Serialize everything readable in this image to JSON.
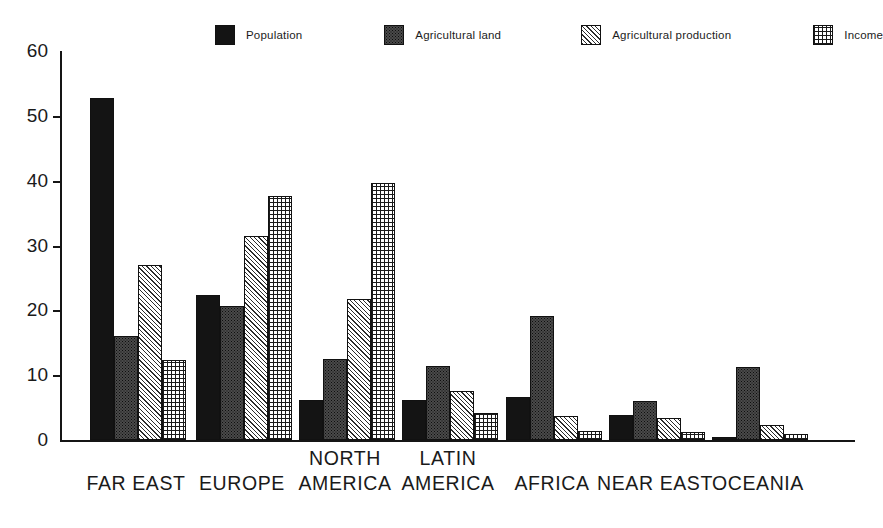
{
  "chart_data": {
    "type": "bar",
    "title": "",
    "subtitle": "",
    "xlabel": "",
    "ylabel": "",
    "ylim": [
      0,
      60
    ],
    "yticks": [
      0,
      10,
      20,
      30,
      40,
      50,
      60
    ],
    "ytick_labels": [
      "0",
      "10",
      "20",
      "30",
      "40",
      "50",
      "60"
    ],
    "grid": false,
    "legend_position": "top",
    "categories": [
      "FAR EAST",
      "EUROPE",
      "NORTH AMERICA",
      "LATIN AMERICA",
      "AFRICA",
      "NEAR EAST",
      "OCEANIA"
    ],
    "category_lines": [
      [
        "FAR EAST"
      ],
      [
        "EUROPE"
      ],
      [
        "NORTH",
        "AMERICA"
      ],
      [
        "LATIN",
        "AMERICA"
      ],
      [
        "AFRICA"
      ],
      [
        "NEAR EAST"
      ],
      [
        "OCEANIA"
      ]
    ],
    "series": [
      {
        "name": "Population",
        "pattern": "solid-black",
        "values": [
          52.7,
          22.3,
          6.2,
          6.2,
          6.6,
          3.9,
          0.4
        ]
      },
      {
        "name": "Agricultural land",
        "pattern": "fine-dots",
        "values": [
          16.0,
          20.6,
          12.5,
          11.4,
          19.2,
          6.0,
          11.2
        ]
      },
      {
        "name": "Agricultural production",
        "pattern": "diagonal-hatch",
        "values": [
          27.0,
          31.5,
          21.8,
          7.6,
          3.7,
          3.4,
          2.3
        ]
      },
      {
        "name": "Income",
        "pattern": "cross-hatch",
        "values": [
          12.3,
          37.7,
          39.7,
          4.2,
          1.4,
          1.2,
          0.9
        ]
      }
    ],
    "annotations": []
  },
  "legend": {
    "items": [
      {
        "label": "Population",
        "pattern": "solid-black"
      },
      {
        "label": "Agricultural land",
        "pattern": "fine-dots"
      },
      {
        "label": "Agricultural production",
        "pattern": "diagonal-hatch"
      },
      {
        "label": "Income",
        "pattern": "cross-hatch"
      }
    ]
  },
  "colors": {
    "background": "#ffffff",
    "axis": "#151515",
    "ink": "#1a1a1a",
    "series_solid": "#141414",
    "series_dots": "#4a4a4a",
    "series_diag": "#2b2b2b",
    "series_grid": "#1a1a1a"
  }
}
